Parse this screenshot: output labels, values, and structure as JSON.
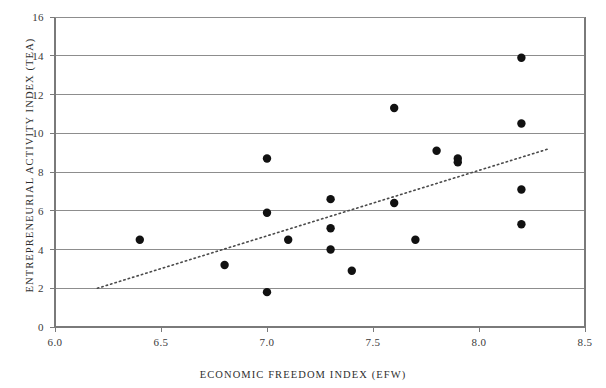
{
  "chart_data": {
    "type": "scatter",
    "title": "",
    "xlabel": "ECONOMIC FREEDOM INDEX (EFW)",
    "ylabel": "ENTREPRENEURIAL ACTIVITY INDEX (TEA)",
    "xlim": [
      6.0,
      8.5
    ],
    "ylim": [
      0,
      16
    ],
    "xticks": [
      "6.0",
      "6.5",
      "7.0",
      "7.5",
      "8.0",
      "8.5"
    ],
    "xtick_values": [
      6.0,
      6.5,
      7.0,
      7.5,
      8.0,
      8.5
    ],
    "yticks": [
      "0",
      "2",
      "4",
      "6",
      "8",
      "10",
      "12",
      "14",
      "16"
    ],
    "ytick_values": [
      0,
      2,
      4,
      6,
      8,
      10,
      12,
      14,
      16
    ],
    "grid": "horizontal",
    "legend": "none",
    "marker": "filled-circle",
    "marker_color": "#111111",
    "points": [
      {
        "x": 6.4,
        "y": 4.5
      },
      {
        "x": 6.8,
        "y": 3.2
      },
      {
        "x": 7.0,
        "y": 8.7
      },
      {
        "x": 7.0,
        "y": 5.9
      },
      {
        "x": 7.0,
        "y": 1.8
      },
      {
        "x": 7.1,
        "y": 4.5
      },
      {
        "x": 7.3,
        "y": 6.6
      },
      {
        "x": 7.3,
        "y": 5.1
      },
      {
        "x": 7.3,
        "y": 4.0
      },
      {
        "x": 7.4,
        "y": 2.9
      },
      {
        "x": 7.6,
        "y": 11.3
      },
      {
        "x": 7.6,
        "y": 6.4
      },
      {
        "x": 7.7,
        "y": 4.5
      },
      {
        "x": 7.8,
        "y": 9.1
      },
      {
        "x": 7.9,
        "y": 8.7
      },
      {
        "x": 7.9,
        "y": 8.5
      },
      {
        "x": 8.2,
        "y": 13.9
      },
      {
        "x": 8.2,
        "y": 10.5
      },
      {
        "x": 8.2,
        "y": 7.1
      },
      {
        "x": 8.2,
        "y": 5.3
      }
    ],
    "trendline": {
      "style": "dotted",
      "x_start": 6.2,
      "y_start": 2.0,
      "x_end": 8.33,
      "y_end": 9.2
    }
  }
}
